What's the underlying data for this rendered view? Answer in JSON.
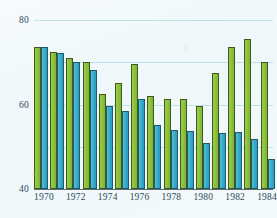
{
  "chart_data": {
    "type": "bar",
    "title": "",
    "subtitle": "",
    "xlabel": "",
    "ylabel": "",
    "grid": true,
    "legend": "none",
    "ylim": [
      0,
      80
    ],
    "yticks": [
      0,
      20,
      40,
      60,
      80
    ],
    "ytick_labels": [
      "0",
      "20",
      "40",
      "60",
      "80"
    ],
    "categories": [
      "1970",
      "1971",
      "1972",
      "1973",
      "1974",
      "1975",
      "1976",
      "1977",
      "1978",
      "1979",
      "1980",
      "1981",
      "1982",
      "1983",
      "1984"
    ],
    "xtick_labels": [
      "1970",
      "1972",
      "1974",
      "1976",
      "1978",
      "1980",
      "1982",
      "1984"
    ],
    "series": [
      {
        "name": "green-series",
        "color": "#8CC63E",
        "values": [
          67,
          65,
          62,
          60,
          45,
          50,
          59,
          44,
          42.5,
          42.5,
          39.5,
          55,
          67,
          71,
          60
        ]
      },
      {
        "name": "blue-series",
        "color": "#3BAFCE",
        "values": [
          67,
          64.5,
          60,
          56.5,
          39.5,
          37,
          42.5,
          30.5,
          28,
          27.5,
          22,
          26.5,
          27,
          23.5,
          14
        ]
      }
    ]
  },
  "colors": {
    "green": "#8CC63E",
    "blue": "#3BAFCE",
    "gridline": "#bfe2ea",
    "axis": "#5c6a70",
    "text": "#2f4a5a",
    "background": "#f2fafc"
  }
}
